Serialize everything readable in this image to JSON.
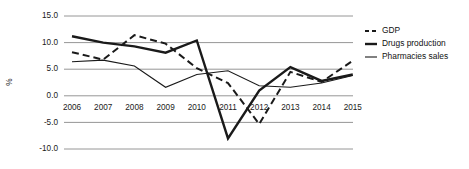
{
  "chart_data": {
    "type": "line",
    "title": "",
    "xlabel": "",
    "ylabel": "%",
    "categories": [
      "2006",
      "2007",
      "2008",
      "2009",
      "2010",
      "2011",
      "2012",
      "2013",
      "2014",
      "2015"
    ],
    "ylim": [
      -10.0,
      15.0
    ],
    "yticks": [
      "15.0",
      "10.0",
      "5.0",
      "0.0",
      "-5.0",
      "-10.0"
    ],
    "ytick_values": [
      15.0,
      10.0,
      5.0,
      0.0,
      -5.0,
      -10.0
    ],
    "grid": true,
    "legend_position": "right",
    "series": [
      {
        "name": "GDP",
        "style": "dashed",
        "color": "#1a1a1a",
        "width": 2.0,
        "values": [
          8.2,
          6.8,
          11.4,
          9.8,
          5.2,
          2.4,
          -5.3,
          4.5,
          2.6,
          6.6
        ]
      },
      {
        "name": "Drugs production",
        "style": "solid-thick",
        "color": "#1a1a1a",
        "width": 2.4,
        "values": [
          11.2,
          10.0,
          9.3,
          8.1,
          10.4,
          -8.0,
          1.0,
          5.4,
          2.8,
          4.0
        ]
      },
      {
        "name": "Pharmacies sales",
        "style": "solid-thin",
        "color": "#1a1a1a",
        "width": 1.1,
        "values": [
          6.4,
          6.7,
          5.6,
          1.6,
          4.0,
          4.7,
          1.9,
          1.6,
          2.4,
          3.8
        ]
      }
    ]
  },
  "legend": {
    "items": [
      {
        "label": "GDP",
        "swatch": "dashed-line-swatch"
      },
      {
        "label": "Drugs production",
        "swatch": "thick-line-swatch"
      },
      {
        "label": "Pharmacies sales",
        "swatch": "thin-line-swatch"
      }
    ]
  },
  "geometry": {
    "plot_left": 72,
    "plot_right": 353,
    "plot_top": 16,
    "plot_bottom": 149,
    "x_step": 31.2,
    "legend_x": 365,
    "legend_y_start": 31,
    "legend_row_height": 13
  }
}
